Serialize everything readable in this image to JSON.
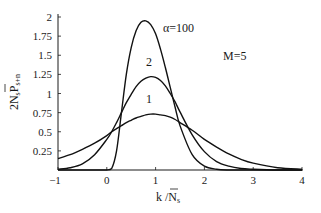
{
  "chart_data": {
    "type": "line",
    "title": "",
    "xlabel": "k / N̄s",
    "ylabel": "2N̄sPs+n",
    "xlim": [
      -1,
      4
    ],
    "ylim": [
      0,
      2
    ],
    "grid": false,
    "legend_position": "none (inline curve labels)",
    "x_ticks": [
      "-1",
      "0",
      "1",
      "2",
      "3",
      "4"
    ],
    "y_ticks": [
      "0.25",
      "0.5",
      "0.75",
      "1",
      "1.25",
      "1.5",
      "1.75",
      "2"
    ],
    "annotations": [
      {
        "text": "α=100",
        "x": 1.3,
        "y": 1.9
      },
      {
        "text": "2",
        "x": 0.9,
        "y": 1.4
      },
      {
        "text": "1",
        "x": 0.9,
        "y": 0.93
      },
      {
        "text": "M=5",
        "x": 2.4,
        "y": 1.45
      }
    ],
    "x": [
      -1.0,
      -0.75,
      -0.5,
      -0.25,
      0.0,
      0.1,
      0.2,
      0.3,
      0.4,
      0.5,
      0.6,
      0.7,
      0.8,
      0.9,
      1.0,
      1.1,
      1.2,
      1.3,
      1.4,
      1.5,
      1.75,
      2.0,
      2.25,
      2.5,
      2.75,
      3.0,
      3.5,
      4.0
    ],
    "series": [
      {
        "name": "1",
        "values": [
          0.15,
          0.2,
          0.27,
          0.35,
          0.45,
          0.5,
          0.54,
          0.58,
          0.62,
          0.65,
          0.68,
          0.7,
          0.72,
          0.73,
          0.73,
          0.72,
          0.71,
          0.69,
          0.66,
          0.62,
          0.52,
          0.4,
          0.3,
          0.21,
          0.14,
          0.09,
          0.03,
          0.01
        ]
      },
      {
        "name": "2",
        "values": [
          0.01,
          0.03,
          0.08,
          0.2,
          0.4,
          0.5,
          0.62,
          0.75,
          0.88,
          0.99,
          1.09,
          1.16,
          1.2,
          1.22,
          1.21,
          1.17,
          1.1,
          1.0,
          0.89,
          0.76,
          0.46,
          0.24,
          0.11,
          0.05,
          0.02,
          0.01,
          0.0,
          0.0
        ]
      },
      {
        "name": "α=100",
        "values": [
          0.0,
          0.0,
          0.0,
          0.0,
          0.0,
          0.02,
          0.25,
          0.75,
          1.25,
          1.6,
          1.82,
          1.93,
          1.95,
          1.9,
          1.78,
          1.58,
          1.34,
          1.08,
          0.82,
          0.58,
          0.2,
          0.05,
          0.01,
          0.0,
          0.0,
          0.0,
          0.0,
          0.0
        ]
      }
    ]
  }
}
